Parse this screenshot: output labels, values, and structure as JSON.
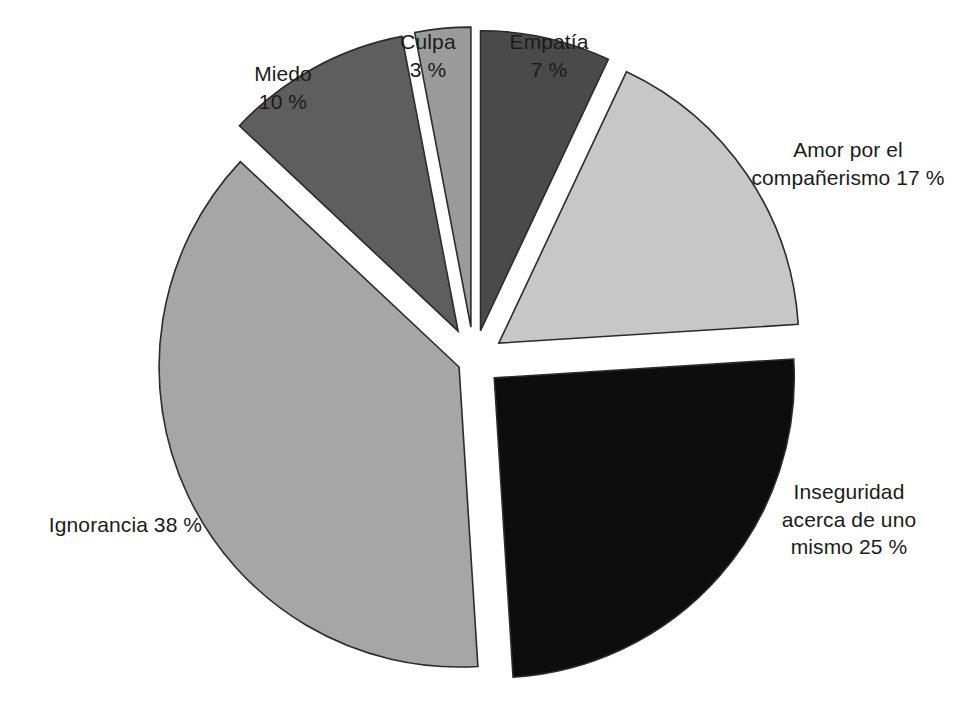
{
  "chart_data": {
    "type": "pie",
    "title": "",
    "subtitle": "",
    "xlabel": "",
    "ylabel": "",
    "legend_position": "none",
    "grid": false,
    "units": "%",
    "value_suffix": " %",
    "total": 100,
    "exploded": true,
    "start_angle_deg": -90,
    "direction": "clockwise",
    "categories": [
      "Empatía",
      "Amor por el compañerismo",
      "Inseguridad acerca de uno mismo",
      "Ignorancia",
      "Miedo",
      "Culpa"
    ],
    "values": [
      7,
      17,
      25,
      38,
      10,
      3
    ],
    "colors": [
      "#4a4a4a",
      "#c7c7c7",
      "#0d0d0d",
      "#a6a6a6",
      "#5e5e5e",
      "#9b9b9b"
    ],
    "slices": [
      {
        "name": "Empatía",
        "value": 7,
        "value_label": "7 %",
        "label_lines": "Empatía\n7 %",
        "color": "#4a4a4a",
        "start_deg": -90,
        "end_deg": -64.8,
        "explode": 0.1
      },
      {
        "name": "Amor por el compañerismo",
        "value": 17,
        "value_label": "17 %",
        "label_lines": "Amor por el\ncompañerismo 17 %",
        "color": "#c7c7c7",
        "start_deg": -64.8,
        "end_deg": -3.6,
        "explode": 0.1
      },
      {
        "name": "Inseguridad acerca de uno mismo",
        "value": 25,
        "value_label": "25 %",
        "label_lines": "Inseguridad\nacerca de uno\nmismo 25 %",
        "color": "#0d0d0d",
        "start_deg": -3.6,
        "end_deg": 86.4,
        "explode": 0.09
      },
      {
        "name": "Ignorancia",
        "value": 38,
        "value_label": "38 %",
        "label_lines": "Ignorancia 38 %",
        "color": "#a6a6a6",
        "start_deg": 86.4,
        "end_deg": 223.2,
        "explode": 0.055
      },
      {
        "name": "Miedo",
        "value": 10,
        "value_label": "10 %",
        "label_lines": "Miedo\n10 %",
        "color": "#5e5e5e",
        "start_deg": 223.2,
        "end_deg": 259.2,
        "explode": 0.11
      },
      {
        "name": "Culpa",
        "value": 3,
        "value_label": "3 %",
        "label_lines": "Culpa\n3 %",
        "color": "#9b9b9b",
        "start_deg": 259.2,
        "end_deg": 270,
        "explode": 0.11
      }
    ],
    "geometry": {
      "cx": 474,
      "cy": 360,
      "r": 300,
      "stroke": "#2b2b2b",
      "stroke_width": 1.6,
      "background": "#ffffff"
    }
  },
  "labels": {
    "miedo": "Miedo\n10 %",
    "culpa": "Culpa\n3 %",
    "empatia": "Empatía\n7 %",
    "amor": "Amor por el\ncompañerismo 17 %",
    "inseguridad": "Inseguridad\nacerca de uno\nmismo 25 %",
    "ignorancia": "Ignorancia 38 %"
  }
}
